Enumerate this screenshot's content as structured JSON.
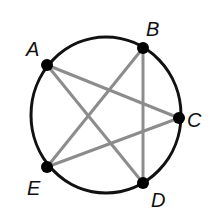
{
  "diagram": {
    "type": "inscribed-pentagram",
    "circle": {
      "cx": 106,
      "cy": 115,
      "rx": 75,
      "ry": 78,
      "stroke": "#111111"
    },
    "points": [
      {
        "id": "A",
        "label": "A",
        "x": 47,
        "y": 65,
        "lx": 26,
        "ly": 56
      },
      {
        "id": "B",
        "label": "B",
        "x": 143,
        "y": 48,
        "lx": 146,
        "ly": 36
      },
      {
        "id": "C",
        "label": "C",
        "x": 179,
        "y": 118,
        "lx": 187,
        "ly": 127
      },
      {
        "id": "E",
        "label": "E",
        "x": 47,
        "y": 167,
        "lx": 27,
        "ly": 195
      },
      {
        "id": "D",
        "label": "D",
        "x": 143,
        "y": 183,
        "lx": 151,
        "ly": 207
      }
    ],
    "chords": [
      {
        "from": "A",
        "to": "C"
      },
      {
        "from": "A",
        "to": "D"
      },
      {
        "from": "B",
        "to": "E"
      },
      {
        "from": "B",
        "to": "D"
      },
      {
        "from": "E",
        "to": "C"
      }
    ],
    "chord_color": "#8c8c8c",
    "point_color": "#000000"
  }
}
